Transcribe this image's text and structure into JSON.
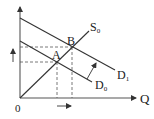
{
  "diagram": {
    "type": "supply-demand",
    "axes": {
      "origin_label": "0",
      "x_label": "Q",
      "y_label": ""
    },
    "curves": [
      {
        "id": "S0",
        "label_main": "S",
        "label_sub": "0",
        "kind": "supply"
      },
      {
        "id": "D0",
        "label_main": "D",
        "label_sub": "0",
        "kind": "demand"
      },
      {
        "id": "D1",
        "label_main": "D",
        "label_sub": "1",
        "kind": "demand"
      }
    ],
    "points": [
      {
        "id": "A",
        "label": "A"
      },
      {
        "id": "B",
        "label": "B"
      }
    ],
    "annotations": {
      "shift_arrow": "demand shift from D0 to D1",
      "price_up_arrow": "price increase",
      "quantity_right_arrow": "quantity increase"
    },
    "colors": {
      "line": "#333333",
      "dashed": "#555555",
      "background": "#ffffff"
    }
  }
}
